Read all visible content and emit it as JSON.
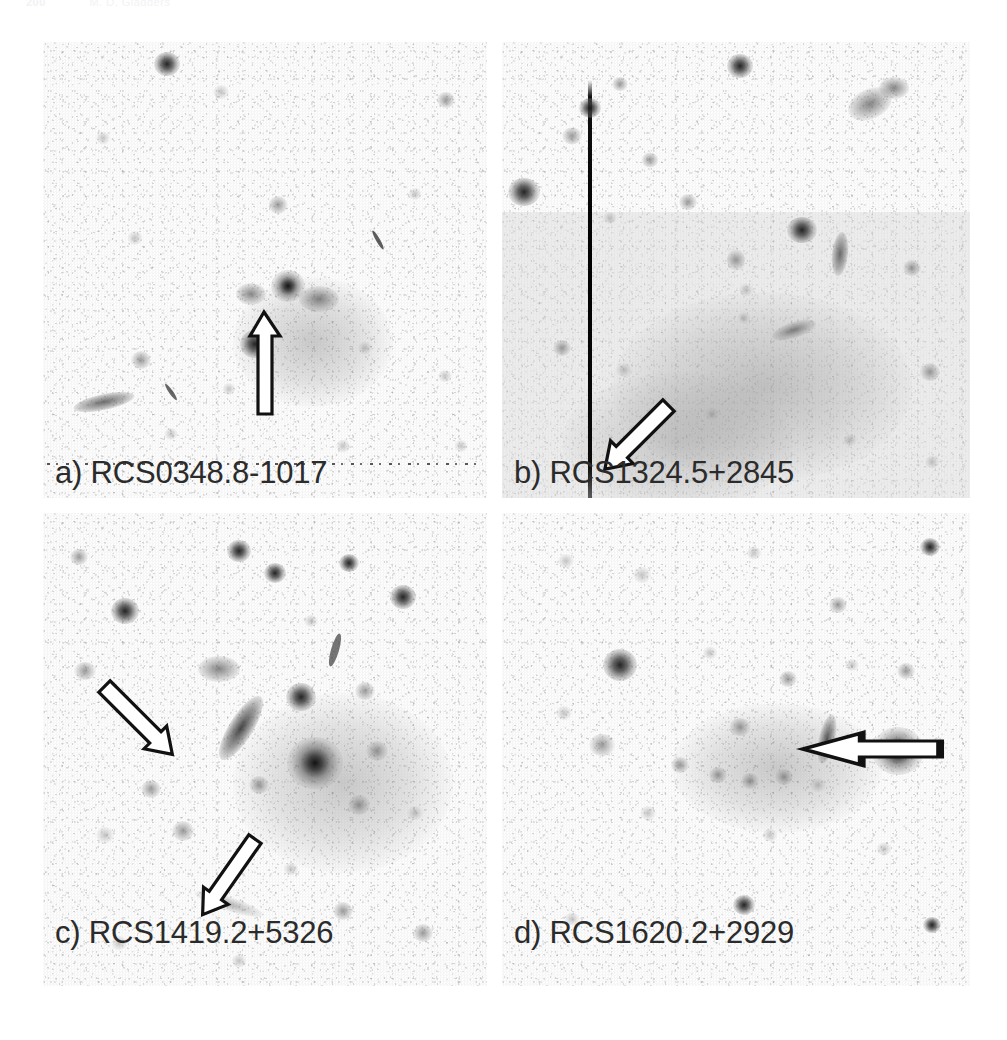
{
  "running_head": {
    "page_number": "200",
    "text": "M. D. Gladders"
  },
  "figure": {
    "type": "astronomical-image-grid",
    "rows": 2,
    "columns": 2,
    "colormap": "inverted-grayscale",
    "panels": [
      {
        "id": "a",
        "label": "a) RCS0348.8-1017",
        "cluster_name": "RCS0348.8-1017",
        "position": "top-left",
        "arrows": [
          {
            "name": "lensed-arc-pointer",
            "direction": "up"
          }
        ],
        "artifacts": [
          "dotted-scan-line"
        ],
        "background_level": "low"
      },
      {
        "id": "b",
        "label": "b) RCS1324.5+2845",
        "cluster_name": "RCS1324.5+2845",
        "position": "top-right",
        "arrows": [
          {
            "name": "lensed-arc-pointer",
            "direction": "down-left"
          }
        ],
        "artifacts": [
          "ccd-bleed-column"
        ],
        "background_level": "high"
      },
      {
        "id": "c",
        "label": "c) RCS1419.2+5326",
        "cluster_name": "RCS1419.2+5326",
        "position": "bottom-left",
        "arrows": [
          {
            "name": "lensed-arc-pointer",
            "direction": "down-right"
          },
          {
            "name": "lensed-arc-pointer-secondary",
            "direction": "down-left"
          }
        ],
        "artifacts": [],
        "background_level": "low"
      },
      {
        "id": "d",
        "label": "d) RCS1620.2+2929",
        "cluster_name": "RCS1620.2+2929",
        "position": "bottom-right",
        "arrows": [
          {
            "name": "lensed-arc-pointer",
            "direction": "left"
          }
        ],
        "artifacts": [],
        "background_level": "low"
      }
    ]
  }
}
